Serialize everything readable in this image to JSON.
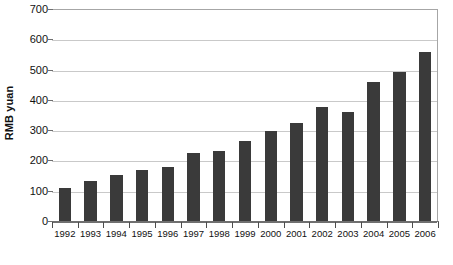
{
  "chart_data": {
    "type": "bar",
    "title": "",
    "subtitle": "",
    "xlabel": "",
    "ylabel": "RMB yuan",
    "ylim": [
      0,
      700
    ],
    "ytick_step": 100,
    "yticks": [
      0,
      100,
      200,
      300,
      400,
      500,
      600,
      700
    ],
    "ytick_labels": [
      "0",
      "100",
      "200",
      "300",
      "400",
      "500",
      "600",
      "700"
    ],
    "grid": true,
    "grid_axis": "y",
    "legend": false,
    "legend_position": "none",
    "categories": [
      "1992",
      "1993",
      "1994",
      "1995",
      "1996",
      "1997",
      "1998",
      "1999",
      "2000",
      "2001",
      "2002",
      "2003",
      "2004",
      "2005",
      "2006"
    ],
    "values": [
      110,
      133,
      152,
      170,
      180,
      225,
      231,
      263,
      296,
      322,
      375,
      361,
      460,
      491,
      559
    ],
    "series": [
      {
        "name": "RMB yuan",
        "values": [
          110,
          133,
          152,
          170,
          180,
          225,
          231,
          263,
          296,
          322,
          375,
          361,
          460,
          491,
          559
        ],
        "color": "#3a3a3a"
      }
    ],
    "annotations": []
  },
  "colors": {
    "bar": "#3a3a3a",
    "gridline": "#c9c9c9",
    "axis": "#6f6f6f",
    "text": "#111111",
    "background": "#ffffff"
  }
}
